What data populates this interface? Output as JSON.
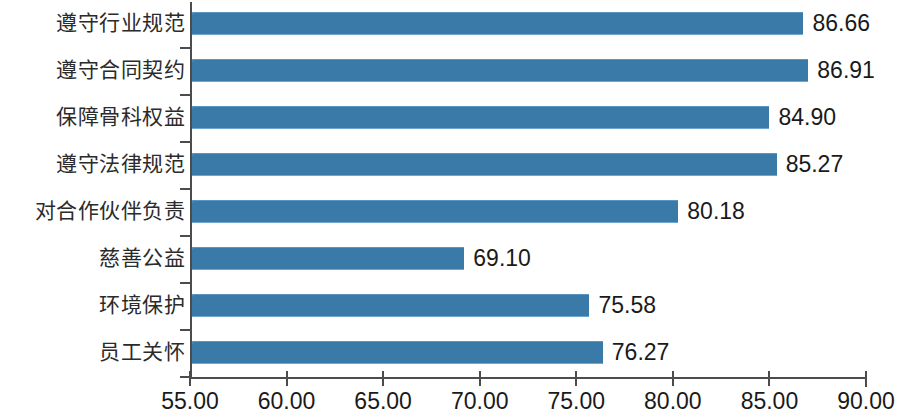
{
  "chart_data": {
    "type": "bar",
    "orientation": "horizontal",
    "title": "",
    "subtitle": "",
    "xlabel": "",
    "ylabel": "",
    "categories": [
      "遵守行业规范",
      "遵守合同契约",
      "保障骨科权益",
      "遵守法律规范",
      "对合作伙伴负责",
      "慈善公益",
      "环境保护",
      "员工关怀"
    ],
    "values": [
      86.66,
      86.91,
      84.9,
      85.27,
      80.18,
      69.1,
      75.58,
      76.27
    ],
    "value_labels": [
      "86.66",
      "86.91",
      "84.90",
      "85.27",
      "80.18",
      "69.10",
      "75.58",
      "76.27"
    ],
    "xlim": [
      55.0,
      90.0
    ],
    "xticks": [
      55.0,
      60.0,
      65.0,
      70.0,
      75.0,
      80.0,
      85.0,
      90.0
    ],
    "xtick_labels": [
      "55.00",
      "60.00",
      "65.00",
      "70.00",
      "75.00",
      "80.00",
      "85.00",
      "90.00"
    ],
    "grid": false,
    "legend": null,
    "series": [
      {
        "name": "",
        "values": [
          86.66,
          86.91,
          84.9,
          85.27,
          80.18,
          69.1,
          75.58,
          76.27
        ]
      }
    ],
    "colors": {
      "bar": "#3c7fb0",
      "bar_highlight": "#6ea6ce",
      "axis": "#4c4c4c",
      "text": "#1a1a1a",
      "category_text": "#2b2b2b",
      "background": "#ffffff"
    }
  }
}
